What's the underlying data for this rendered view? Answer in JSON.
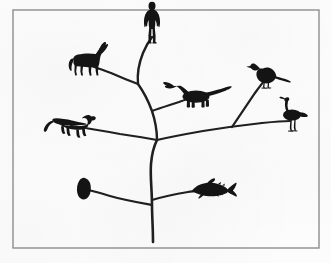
{
  "figure": {
    "width": 331,
    "height": 263,
    "background_color": "#fcfcfc",
    "ink_color": "#1a1a1a",
    "border_color": "#8d8d8d"
  },
  "border": {
    "name": "figure-border",
    "x": 13,
    "y": 10,
    "width": 306,
    "height": 238,
    "stroke_width": 1.4,
    "color": "#8d8d8d"
  },
  "tree": {
    "name": "evolutionary-tree",
    "stroke_color": "#1f1f1f",
    "root": {
      "x": 153,
      "y": 242
    },
    "branches": [
      {
        "id": "trunk",
        "label": "main trunk",
        "path": "M153,242 C153,228 152,216 152,205 C152,190 150,176 151,164 C152,152 154,146 157,140",
        "width": 2.6
      },
      {
        "id": "branch-invertebrate",
        "label": "branch to invertebrate",
        "path": "M152,205 C141,203 124,200 110,196 C100,193 92,191 85,189",
        "width": 2.2
      },
      {
        "id": "branch-fish",
        "label": "branch to fish",
        "path": "M152,200 C162,197 176,194 188,192 C196,191 202,190 208,190",
        "width": 2.2
      },
      {
        "id": "fork-left-low",
        "label": "lower-left fork to dog lineage",
        "path": "M157,140 C147,138 134,136 120,134 C104,131 86,128 71,126",
        "width": 2.2
      },
      {
        "id": "fork-right-low",
        "label": "lower-right fork to bird lineage",
        "path": "M157,140 C170,137 186,134 203,131 C222,128 244,125 262,123",
        "width": 2.2
      },
      {
        "id": "branch-wading-bird",
        "label": "branch to wading bird",
        "path": "M262,123 C272,122 282,121 290,121",
        "width": 2.2
      },
      {
        "id": "branch-songbird",
        "label": "branch to songbird",
        "path": "M232,127 C240,115 249,102 255,93 C260,86 263,82 266,79",
        "width": 2.2
      },
      {
        "id": "branch-upper-stem",
        "label": "upper stem to dinosaur and mammals",
        "path": "M157,140 C157,130 155,120 152,111 C148,100 143,91 138,84",
        "width": 2.4
      },
      {
        "id": "branch-dinosaur",
        "label": "branch to dinosaur",
        "path": "M152,111 C160,108 170,105 179,102 C187,99 193,97 198,96",
        "width": 2.2
      },
      {
        "id": "branch-horse",
        "label": "branch to horse",
        "path": "M138,84 C130,81 120,77 111,73 C103,70 97,68 92,66",
        "width": 2.2
      },
      {
        "id": "branch-human",
        "label": "branch to human",
        "path": "M138,84 C137,74 139,63 143,53 C146,46 149,41 152,37",
        "width": 2.4
      }
    ]
  },
  "silhouettes": [
    {
      "id": "human",
      "name": "human-silhouette",
      "label": "Human",
      "x": 152,
      "y": 22,
      "scale": 1.0,
      "position_note": "top of central branch"
    },
    {
      "id": "horse",
      "name": "horse-silhouette",
      "label": "Horse",
      "x": 90,
      "y": 63,
      "scale": 1.0,
      "position_note": "upper-left branch tip"
    },
    {
      "id": "dinosaur",
      "name": "dinosaur-silhouette",
      "label": "Sauropod dinosaur",
      "x": 198,
      "y": 96,
      "scale": 1.0,
      "position_note": "center, branch to the right of upper stem"
    },
    {
      "id": "songbird",
      "name": "songbird-silhouette",
      "label": "Perching bird",
      "x": 266,
      "y": 78,
      "scale": 1.0,
      "position_note": "upper-right branch tip"
    },
    {
      "id": "wading-bird",
      "name": "wading-bird-silhouette",
      "label": "Wading bird",
      "x": 292,
      "y": 120,
      "scale": 1.0,
      "position_note": "far-right horizontal branch tip"
    },
    {
      "id": "dog",
      "name": "dog-silhouette",
      "label": "Dog",
      "x": 68,
      "y": 126,
      "scale": 1.0,
      "position_note": "left branch tip"
    },
    {
      "id": "invertebrate",
      "name": "invertebrate-silhouette",
      "label": "Invertebrate",
      "x": 84,
      "y": 189,
      "scale": 1.0,
      "position_note": "lower-left branch tip"
    },
    {
      "id": "fish",
      "name": "fish-silhouette",
      "label": "Fish",
      "x": 209,
      "y": 190,
      "scale": 1.0,
      "position_note": "lower-right branch tip"
    }
  ]
}
